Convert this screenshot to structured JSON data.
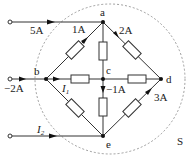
{
  "diagram": {
    "nodes": [
      {
        "id": "a",
        "label": "a"
      },
      {
        "id": "b",
        "label": "b"
      },
      {
        "id": "c",
        "label": "c"
      },
      {
        "id": "d",
        "label": "d"
      },
      {
        "id": "e",
        "label": "e"
      }
    ],
    "currents": {
      "top_input": "5A",
      "ab": "1A",
      "ad": "2A",
      "b_input": "−2A",
      "I1": "I",
      "I1_sub": "1",
      "ce": "−1A",
      "ed": "3A",
      "I2": "I",
      "I2_sub": "2"
    },
    "surface_label": "S"
  }
}
